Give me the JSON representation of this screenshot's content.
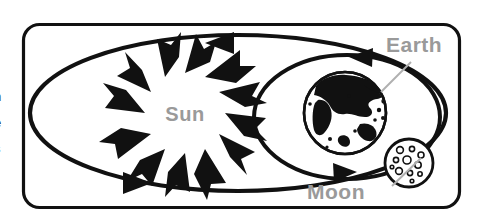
{
  "figure": {
    "frame": {
      "border_color": "#111111",
      "background_color": "#ffffff",
      "corner_radius": 16
    }
  },
  "labels": {
    "sun": "Sun",
    "earth": "Earth",
    "moon": "Moon",
    "label_color": "#9a9a9a",
    "leader_color": "#b0b0b0"
  },
  "cut_off_text": {
    "line1": "n",
    "line2": "e",
    "line3": "s",
    "color": "#1b1b1b"
  },
  "bodies": [
    {
      "name": "sun",
      "label": "Sun",
      "cx": 185,
      "cy": 113,
      "radius": 40,
      "style": "white-disk-with-black-flame-rays",
      "ray_count": 16
    },
    {
      "name": "earth",
      "label": "Earth",
      "cx": 345,
      "cy": 113,
      "radius": 41,
      "style": "white-globe-with-black-continents"
    },
    {
      "name": "moon",
      "label": "Moon",
      "cx": 409,
      "cy": 163,
      "radius": 24,
      "style": "white-disk-with-craters",
      "crater_count": 11
    }
  ],
  "orbits": [
    {
      "name": "earth-orbit-around-sun",
      "type": "ellipse",
      "cx": 238,
      "cy": 113,
      "rx": 208,
      "ry": 78,
      "stroke_color": "#111111",
      "stroke_width": 4.2,
      "arrows": [
        {
          "name": "earth-orbit-arrow-top",
          "x": 222,
          "y": 43,
          "direction": "left"
        },
        {
          "name": "earth-orbit-arrow-bottom",
          "x": 135,
          "y": 183,
          "direction": "right"
        }
      ]
    },
    {
      "name": "moon-orbit-around-earth",
      "type": "ellipse",
      "cx": 347,
      "cy": 117,
      "rx": 93,
      "ry": 62,
      "stroke_color": "#111111",
      "stroke_width": 4.0,
      "arrows": [
        {
          "name": "moon-orbit-arrow-top",
          "x": 363,
          "y": 57,
          "direction": "left"
        },
        {
          "name": "moon-orbit-arrow-bottom",
          "x": 343,
          "y": 172,
          "direction": "right"
        }
      ]
    }
  ],
  "leaders": [
    {
      "name": "earth-leader-line",
      "x1": 411,
      "y1": 62,
      "x2": 381,
      "y2": 92
    },
    {
      "name": "moon-leader-line",
      "x1": 392,
      "y1": 186,
      "x2": 421,
      "y2": 158
    }
  ]
}
